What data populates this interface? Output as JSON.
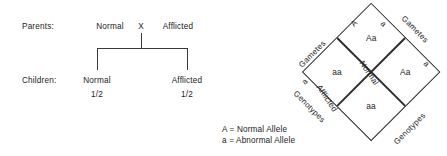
{
  "pedigree": {
    "parents_label": "Parents:",
    "children_label": "Children:",
    "parent_left": "Normal",
    "cross_symbol": "X",
    "parent_right": "Afflicted",
    "child_left": "Normal",
    "child_left_ratio": "1/2",
    "child_right": "Afflicted",
    "child_right_ratio": "1/2"
  },
  "punnett": {
    "cells": {
      "top": "Aa",
      "left": "aa",
      "right": "Aa",
      "bottom": "aa"
    },
    "phenotype_normal": "Normal",
    "phenotype_afflicted": "Afflicted",
    "edges": {
      "gametes_left": "Gametes",
      "gametes_right": "Gametes",
      "genotypes_left": "Genotypes",
      "genotypes_right": "Genotypes",
      "allele_top_left": "A",
      "allele_top_right": "a",
      "allele_mid_left": "a",
      "allele_mid_right": "a"
    }
  },
  "legend": {
    "line1": "A = Normal Allele",
    "line2": "a = Abnormal Allele"
  },
  "colors": {
    "ink": "#1b1b1b",
    "stroke": "#2e2e2e",
    "background": "#ffffff"
  }
}
